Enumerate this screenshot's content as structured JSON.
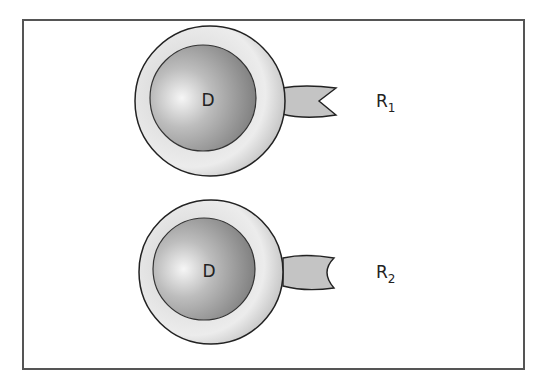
{
  "figure": {
    "frame": {
      "stroke": "#555555"
    },
    "cells": [
      {
        "id": "cell-1",
        "nucleus_label": "D",
        "receptor_label_main": "R",
        "receptor_label_sub": "1",
        "receptor_shape": "v-notch"
      },
      {
        "id": "cell-2",
        "nucleus_label": "D",
        "receptor_label_main": "R",
        "receptor_label_sub": "2",
        "receptor_shape": "rounded-notch"
      }
    ],
    "colors": {
      "outer_light": "#f2f2f2",
      "outer_dark": "#a8a8a8",
      "inner_light": "#f4f4f4",
      "inner_dark": "#7a7a7a",
      "receptor_fill": "#c4c4c4",
      "outline": "#222222"
    }
  }
}
